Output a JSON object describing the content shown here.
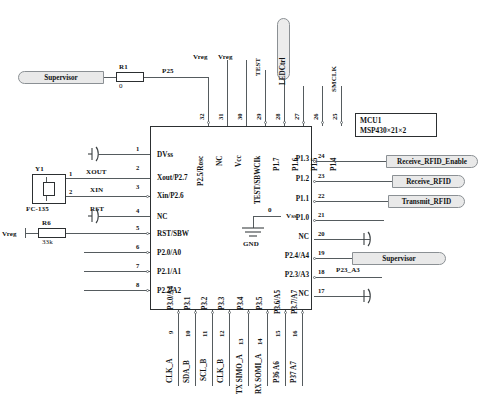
{
  "title_block": {
    "ref": "MCU1",
    "part": "MSP430×21×2"
  },
  "chip": {
    "name": "MSP430 MCU",
    "left_pins": [
      {
        "num": "1",
        "name": "DVss"
      },
      {
        "num": "2",
        "name": "Xout/P2.7"
      },
      {
        "num": "3",
        "name": "Xin/P2.6"
      },
      {
        "num": "4",
        "name": "NC"
      },
      {
        "num": "5",
        "name": "RST/SBW"
      },
      {
        "num": "6",
        "name": "P2.0/A0"
      },
      {
        "num": "7",
        "name": "P2.1/A1"
      },
      {
        "num": "8",
        "name": "P2.2/A2"
      }
    ],
    "bottom_pins": [
      {
        "num": "9",
        "name": "P3.0/A4",
        "net": "CLK_A"
      },
      {
        "num": "10",
        "name": "P3.1",
        "net": "SDA_B"
      },
      {
        "num": "11",
        "name": "P3.2",
        "net": "SCL_B"
      },
      {
        "num": "12",
        "name": "P3.3",
        "net": "CLK_B"
      },
      {
        "num": "13",
        "name": "P3.4",
        "net": "TX SIMO_A"
      },
      {
        "num": "14",
        "name": "P3.5",
        "net": "RX SOMI_A"
      },
      {
        "num": "15",
        "name": "P3.6/A5",
        "net": "P36 A6"
      },
      {
        "num": "16",
        "name": "P3.7/A7",
        "net": "P37 A7"
      }
    ],
    "right_pins": [
      {
        "num": "17",
        "name": "NC",
        "net": ""
      },
      {
        "num": "18",
        "name": "P2.3/A3",
        "net": "P23_A3"
      },
      {
        "num": "19",
        "name": "P2.4/A4",
        "net": "Supervisor"
      },
      {
        "num": "20",
        "name": "NC",
        "net": ""
      },
      {
        "num": "21",
        "name": "P1.0",
        "net": ""
      },
      {
        "num": "22",
        "name": "P1.1",
        "net": "Transmit_RFID"
      },
      {
        "num": "23",
        "name": "P1.2",
        "net": "Receive_RFID"
      },
      {
        "num": "24",
        "name": "P1.3",
        "net": "Receive_RFID_Enable"
      }
    ],
    "top_pins": [
      {
        "num": "25",
        "name": "P1.4",
        "net": "SMCLK"
      },
      {
        "num": "26",
        "name": "P1.5",
        "net": ""
      },
      {
        "num": "27",
        "name": "P1.6",
        "net": ""
      },
      {
        "num": "28",
        "name": "P1.7",
        "net": "LEDCtrl"
      },
      {
        "num": "29",
        "name": "TEST/SBWCIk",
        "net": "TEST"
      },
      {
        "num": "30",
        "name": "Vcc",
        "net": "Vreg"
      },
      {
        "num": "31",
        "name": "NC",
        "net": "Vreg"
      },
      {
        "num": "32",
        "name": "P2.5/Rosc",
        "net": "P25"
      }
    ]
  },
  "components": {
    "r1": {
      "ref": "R1",
      "value": "0"
    },
    "r6": {
      "ref": "R6",
      "value": "33k"
    },
    "y1": {
      "ref": "Y1",
      "value": "FC-135",
      "pin1": "1",
      "pin2": "2"
    }
  },
  "nets": {
    "supervisor_top": "Supervisor",
    "p25": "P25",
    "vreg_left": "Vreg",
    "xout": "XOUT",
    "xin": "XIN",
    "rst": "RST",
    "gnd_label": "GND",
    "gnd_vss": "Vss",
    "gnd_value": "0"
  }
}
